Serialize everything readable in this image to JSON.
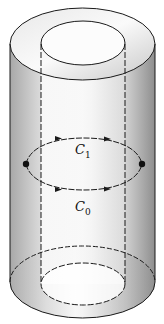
{
  "figure": {
    "labels": {
      "c1": {
        "base": "C",
        "sub": "1"
      },
      "c0": {
        "base": "C",
        "sub": "0"
      }
    },
    "colors": {
      "line": "#1a1a1a",
      "shade_light": "#ffffff",
      "shade_dark": "#9a9a9a",
      "hidden_line": "#ffffff"
    }
  }
}
